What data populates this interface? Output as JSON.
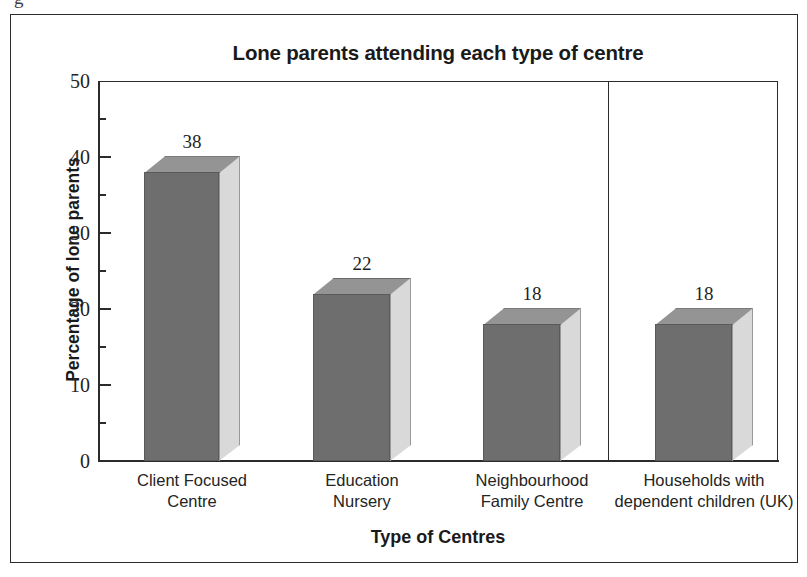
{
  "figure": {
    "stray_glyph": "g"
  },
  "chart_data": {
    "type": "bar",
    "title": "Lone parents attending each type of centre",
    "xlabel": "Type of Centres",
    "ylabel": "Percentage of lone parents",
    "categories": [
      "Client Focused\nCentre",
      "Education\nNursery",
      "Neighbourhood\nFamily Centre",
      "Households with\ndependent children (UK)"
    ],
    "category_lines": [
      [
        "Client Focused",
        "Centre"
      ],
      [
        "Education",
        "Nursery"
      ],
      [
        "Neighbourhood",
        "Family Centre"
      ],
      [
        "Households with",
        "dependent children (UK)"
      ]
    ],
    "values": [
      38,
      22,
      18,
      18
    ],
    "data_labels": [
      "38",
      "22",
      "18",
      "18"
    ],
    "ylim": [
      0,
      50
    ],
    "y_major_ticks": [
      0,
      10,
      20,
      30,
      40,
      50
    ],
    "y_minor_ticks": [
      5,
      15,
      25,
      35,
      45
    ],
    "y_tick_labels": [
      "50",
      "40",
      "30",
      "20",
      "10",
      "0"
    ],
    "grid": false,
    "legend": false,
    "divider_after_category_index": 2,
    "style": {
      "bar_front_color": "#6e6e6e",
      "bar_top_color": "#949494",
      "bar_side_color": "#d9d9d9",
      "axis_color": "#2b2b2b",
      "background": "#ffffff"
    }
  }
}
